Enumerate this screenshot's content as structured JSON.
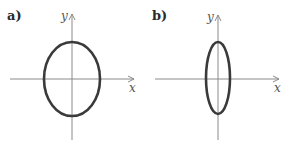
{
  "panels": [
    {
      "label": "a)",
      "x_axis_label": "x",
      "y_axis_label": "y",
      "shape": "ellipse",
      "description": "Ellipse slightly taller than wide, centered at origin"
    },
    {
      "label": "b)",
      "x_axis_label": "x",
      "y_axis_label": "y",
      "shape": "ellipse",
      "description": "Narrow vertically elongated ellipse centered at origin"
    }
  ],
  "colors": {
    "axis": "#8a8a8a",
    "curve": "#3a3a3a",
    "label": "#2a2a2a"
  }
}
